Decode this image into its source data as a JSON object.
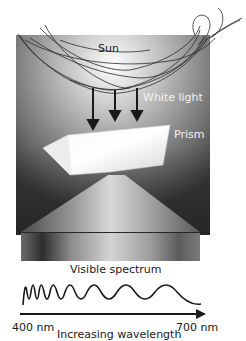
{
  "diagram": {
    "labels": {
      "sun": "Sun",
      "white_light": "White light",
      "prism": "Prism",
      "visible_spectrum": "Visible spectrum",
      "wavelength_start": "400 nm",
      "wavelength_end": "700 nm",
      "axis_caption": "Increasing wavelength"
    },
    "colors": {
      "background": "#ffffff",
      "panel_dark": "#3a3a3a",
      "panel_light": "#d8d8d8",
      "line": "#1a1a1a"
    }
  }
}
